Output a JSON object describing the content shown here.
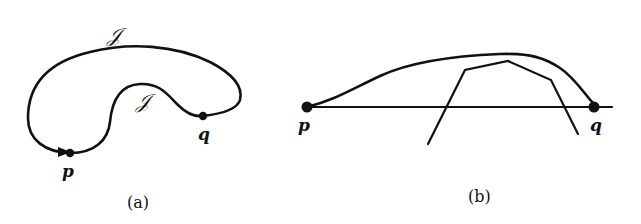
{
  "figure": {
    "panel_a": {
      "caption": "(a)",
      "points": [
        {
          "label": "p",
          "x": 70,
          "y": 153
        },
        {
          "label": "q",
          "x": 203,
          "y": 116
        }
      ],
      "curve_labels": [
        {
          "label": "𝒥",
          "position": "outer"
        },
        {
          "label": "𝒥",
          "position": "inner"
        }
      ]
    },
    "panel_b": {
      "caption": "(b)",
      "points": [
        {
          "label": "p",
          "x": 307,
          "y": 107
        },
        {
          "label": "q",
          "x": 594,
          "y": 107
        }
      ]
    },
    "colors": {
      "ink": "#111111",
      "background": "#ffffff"
    }
  }
}
